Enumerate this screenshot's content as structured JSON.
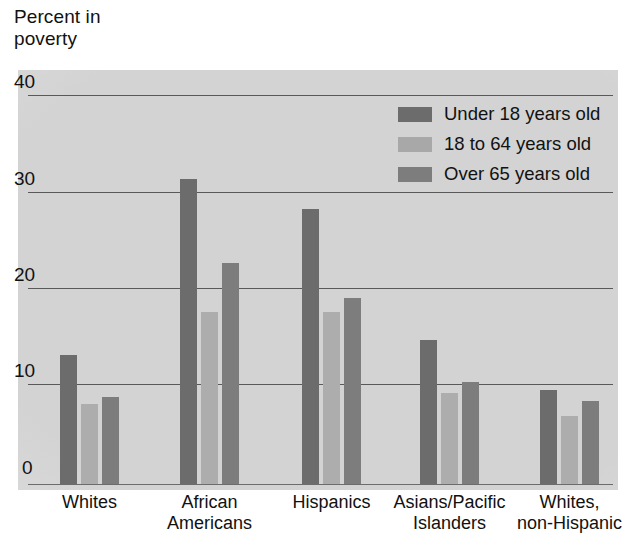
{
  "chart_data": {
    "type": "bar",
    "title": "Percent in poverty",
    "xlabel": "",
    "ylabel": "Percent in poverty",
    "ylim": [
      0,
      40
    ],
    "yticks": [
      0,
      10,
      20,
      30,
      40
    ],
    "grid": true,
    "legend_position": "top-right",
    "categories": [
      "Whites",
      "African Americans",
      "Hispanics",
      "Asians/Pacific Islanders",
      "Whites, non-Hispanic"
    ],
    "category_lines": [
      [
        "Whites",
        ""
      ],
      [
        "African",
        "Americans"
      ],
      [
        "Hispanics",
        ""
      ],
      [
        "Asians/Pacific",
        "Islanders"
      ],
      [
        "Whites,",
        "non-Hispanic"
      ]
    ],
    "series": [
      {
        "name": "Under 18 years old",
        "color": "#6c6c6c",
        "values": [
          13.3,
          31.4,
          28.3,
          14.8,
          9.7
        ]
      },
      {
        "name": "18 to 64 years old",
        "color": "#a8a8a8",
        "values": [
          8.2,
          17.7,
          17.7,
          9.4,
          7.0
        ]
      },
      {
        "name": "Over 65 years old",
        "color": "#7d7d7d",
        "values": [
          8.9,
          22.7,
          19.1,
          10.5,
          8.5
        ]
      }
    ]
  },
  "legend": {
    "items": [
      {
        "label": "Under 18 years old",
        "color": "#6c6c6c"
      },
      {
        "label": "18 to 64 years old",
        "color": "#a8a8a8"
      },
      {
        "label": "Over 65 years old",
        "color": "#7d7d7d"
      }
    ]
  },
  "axis": {
    "title_text": "Percent in\npoverty",
    "ytick_labels": [
      "40",
      "30",
      "20",
      "10",
      "0"
    ]
  }
}
